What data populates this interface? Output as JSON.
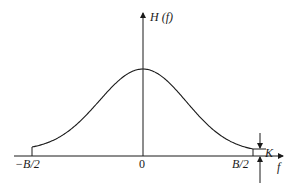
{
  "diagram": {
    "type": "frequency-response",
    "y_axis_label": "H (f)",
    "x_axis_label": "f",
    "tick_labels": {
      "left": "−B/2",
      "center": "0",
      "right": "B/2"
    },
    "offset_label": "K",
    "curve": {
      "shape": "raised bell (cosine-like) centered at 0",
      "x_range": [
        "-B/2",
        "B/2"
      ],
      "edge_value": "K"
    },
    "colors": {
      "stroke": "#1a1a1a",
      "background": "#ffffff"
    }
  }
}
